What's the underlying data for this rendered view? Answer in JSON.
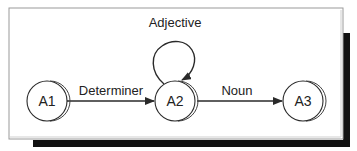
{
  "diagram": {
    "type": "state-transition",
    "colors": {
      "stroke": "#2a2a2a",
      "frame": "#9a9a9a",
      "shadow": "#111111",
      "text": "#222222"
    },
    "nodes": [
      {
        "id": "A1",
        "label": "A1"
      },
      {
        "id": "A2",
        "label": "A2"
      },
      {
        "id": "A3",
        "label": "A3"
      }
    ],
    "edges": [
      {
        "from": "A1",
        "to": "A2",
        "label": "Determiner"
      },
      {
        "from": "A2",
        "to": "A2",
        "label": "Adjective"
      },
      {
        "from": "A2",
        "to": "A3",
        "label": "Noun"
      }
    ]
  }
}
